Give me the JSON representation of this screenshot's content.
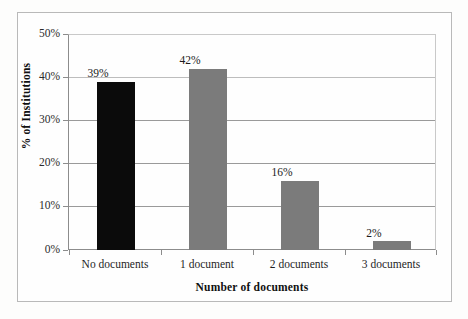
{
  "chart_data": {
    "type": "bar",
    "title": "",
    "xlabel": "Number of documents",
    "ylabel": "% of Institutions",
    "categories": [
      "No documents",
      "1 document",
      "2 documents",
      "3 documents"
    ],
    "values": [
      39,
      42,
      16,
      2
    ],
    "value_labels": [
      "39%",
      "42%",
      "16%",
      "2%"
    ],
    "ylim": [
      0,
      50
    ],
    "ytick_labels": [
      "0%",
      "10%",
      "20%",
      "30%",
      "40%",
      "50%"
    ],
    "ytick_values": [
      0,
      10,
      20,
      30,
      40,
      50
    ],
    "grid": "horizontal",
    "legend": "none",
    "bar_colors": [
      "#0b0b0b",
      "#7b7b7b",
      "#7b7b7b",
      "#7b7b7b"
    ],
    "axis_color": "#8c8c8c",
    "gridline_color": "#9a9a9a",
    "background_color": "#fefefe",
    "frame_color": "#b9b9b9"
  }
}
